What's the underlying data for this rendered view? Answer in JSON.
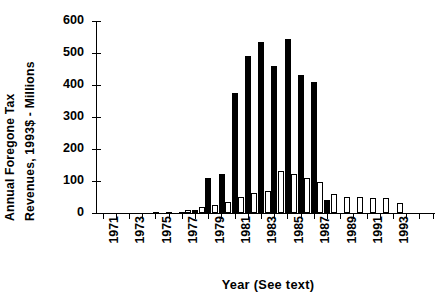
{
  "chart_data": {
    "type": "bar",
    "title": "",
    "xlabel": "Year  (See  text)",
    "ylabel": "Annual Foregone Tax Revenues, 1993$ - Millions",
    "ylabel_lines": [
      "Annual  Foregone  Tax",
      "Revenues,  1993$  -  Millions"
    ],
    "ylim": [
      0,
      600
    ],
    "yticks": [
      0,
      100,
      200,
      300,
      400,
      500,
      600
    ],
    "ytick_labels": [
      "0",
      "100",
      "200",
      "300",
      "400",
      "500",
      "600"
    ],
    "grid": false,
    "legend": "none",
    "categories": [
      "1971",
      "1972",
      "1973",
      "1974",
      "1975",
      "1976",
      "1977",
      "1978",
      "1979",
      "1980",
      "1981",
      "1982",
      "1983",
      "1984",
      "1985",
      "1986",
      "1987",
      "1988",
      "1989",
      "1990",
      "1991",
      "1992",
      "1993",
      "1994"
    ],
    "xtick_labels": [
      "1971",
      "1973",
      "1975",
      "1977",
      "1979",
      "1981",
      "1983",
      "1985",
      "1987",
      "1989",
      "1991",
      "1993"
    ],
    "xtick_label_every": 2,
    "series": [
      {
        "name": "solid",
        "style": "filled-black",
        "color": "#000000",
        "values": [
          0,
          0,
          0,
          0,
          2,
          2,
          4,
          8,
          108,
          122,
          375,
          492,
          535,
          460,
          545,
          432,
          408,
          40,
          0,
          0,
          0,
          0,
          0,
          0
        ]
      },
      {
        "name": "hollow",
        "style": "white-outlined",
        "color": "#ffffff",
        "edgecolor": "#000000",
        "values": [
          0,
          0,
          0,
          0,
          0,
          0,
          10,
          18,
          24,
          35,
          50,
          62,
          70,
          130,
          122,
          108,
          98,
          58,
          50,
          50,
          48,
          46,
          30,
          0
        ]
      }
    ],
    "annotations": []
  },
  "axis": {
    "y_title_line1": "Annual  Foregone  Tax",
    "y_title_line2": "Revenues,  1993$  -  Millions",
    "x_title": "Year  (See  text)"
  }
}
